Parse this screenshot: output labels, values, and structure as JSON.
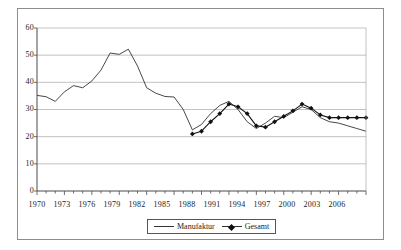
{
  "chart_data": {
    "type": "line",
    "title": "",
    "subtitle": "",
    "xlabel": "",
    "ylabel": "",
    "xlim": [
      1970,
      2006
    ],
    "ylim": [
      0,
      60
    ],
    "grid": true,
    "legend_position": "bottom",
    "y_ticks": [
      0,
      10,
      20,
      30,
      40,
      50,
      60
    ],
    "x_ticks": [
      1970,
      1973,
      1976,
      1979,
      1982,
      1985,
      1988,
      1991,
      1994,
      1997,
      2000,
      2003,
      2006
    ],
    "x_tick_labels": [
      "1970",
      "1973",
      "1976",
      "1979",
      "1982",
      "1985",
      "1988",
      "1991",
      "1994",
      "1997",
      "2000",
      "2003",
      "2006"
    ],
    "y_tick_labels": [
      "0",
      "10",
      "20",
      "30",
      "40",
      "50",
      "60"
    ],
    "x_minor_tick_interval": 1,
    "series": [
      {
        "name": "Manufaktur",
        "marker": "none",
        "color": "#333333",
        "x": [
          1970,
          1971,
          1972,
          1973,
          1974,
          1975,
          1976,
          1977,
          1978,
          1979,
          1980,
          1981,
          1982,
          1983,
          1984,
          1985,
          1986,
          1987,
          1988,
          1989,
          1990,
          1991,
          1992,
          1993,
          1994,
          1995,
          1996,
          1997,
          1998,
          1999,
          2000,
          2001,
          2002,
          2003,
          2004,
          2005,
          2006
        ],
        "values": [
          35.2,
          34.7,
          33.0,
          36.5,
          38.8,
          38.0,
          40.5,
          44.5,
          50.8,
          50.3,
          52.2,
          46.0,
          38.0,
          36.0,
          34.8,
          34.6,
          30.0,
          22.5,
          24.5,
          28.5,
          31.5,
          33.0,
          30.0,
          25.5,
          23.0,
          25.0,
          27.5,
          27.0,
          29.0,
          31.0,
          30.0,
          27.0,
          25.5,
          25.0,
          24.0,
          23.0,
          22.0
        ]
      },
      {
        "name": "Gesamt",
        "marker": "diamond",
        "color": "#111111",
        "x": [
          1987,
          1988,
          1989,
          1990,
          1991,
          1992,
          1993,
          1994,
          1995,
          1996,
          1997,
          1998,
          1999,
          2000,
          2001,
          2002,
          2003,
          2004,
          2005,
          2006
        ],
        "values": [
          21.0,
          22.0,
          25.5,
          28.5,
          32.0,
          31.0,
          28.5,
          24.0,
          23.5,
          25.5,
          27.5,
          29.5,
          32.0,
          30.5,
          28.0,
          27.0,
          27.0,
          27.0,
          27.0,
          27.0
        ]
      }
    ]
  },
  "legend": {
    "items": [
      {
        "label": "Manufaktur",
        "marker": "line"
      },
      {
        "label": "Gesamt",
        "marker": "line-diamond"
      }
    ]
  },
  "colors": {
    "axis": "#4a4a4a",
    "grid": "#9a9a9a",
    "series_manufaktur": "#333333",
    "series_gesamt": "#111111",
    "frame": "#8d8d8d",
    "background": "#ffffff"
  }
}
